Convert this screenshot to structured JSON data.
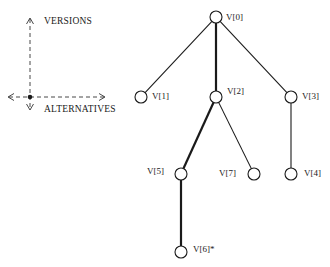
{
  "legend": {
    "vertical_axis_label": "VERSIONS",
    "horizontal_axis_label": "ALTERNATIVES"
  },
  "tree": {
    "nodes": [
      {
        "id": "V0",
        "label": "V[0]",
        "x": 216,
        "y": 17,
        "label_dx": 10,
        "label_dy": 3
      },
      {
        "id": "V1",
        "label": "V[1]",
        "x": 141,
        "y": 97,
        "label_dx": 11,
        "label_dy": 2
      },
      {
        "id": "V2",
        "label": "V[2]",
        "x": 216,
        "y": 97,
        "label_dx": 11,
        "label_dy": -3
      },
      {
        "id": "V3",
        "label": "V[3]",
        "x": 291,
        "y": 97,
        "label_dx": 11,
        "label_dy": 2
      },
      {
        "id": "V5",
        "label": "V[5]",
        "x": 181,
        "y": 174,
        "label_dx": -34,
        "label_dy": 0
      },
      {
        "id": "V7",
        "label": "V[7]",
        "x": 254,
        "y": 174,
        "label_dx": -35,
        "label_dy": 2
      },
      {
        "id": "V4",
        "label": "V[4]",
        "x": 291,
        "y": 174,
        "label_dx": 13,
        "label_dy": 2
      },
      {
        "id": "V6",
        "label": "V[6]*",
        "x": 181,
        "y": 252,
        "label_dx": 12,
        "label_dy": 0
      }
    ],
    "edges": [
      {
        "from": "V0",
        "to": "V1",
        "thick": false
      },
      {
        "from": "V0",
        "to": "V2",
        "thick": true
      },
      {
        "from": "V0",
        "to": "V3",
        "thick": false
      },
      {
        "from": "V2",
        "to": "V5",
        "thick": true
      },
      {
        "from": "V2",
        "to": "V7",
        "thick": false
      },
      {
        "from": "V3",
        "to": "V4",
        "thick": false
      },
      {
        "from": "V5",
        "to": "V6",
        "thick": true
      }
    ],
    "current_version": "V[6]*"
  },
  "colors": {
    "ink": "#1a1a1a",
    "background": "#ffffff"
  }
}
